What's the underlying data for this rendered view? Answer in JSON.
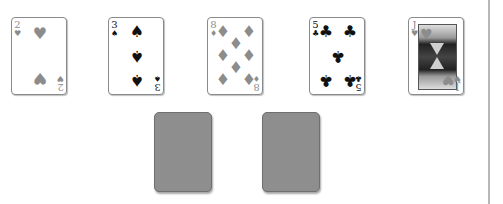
{
  "colors": {
    "red_suit": "#8c8c8c",
    "black_suit": "#111111",
    "card_back": "#8e8e8e",
    "divider": "#b8b8b8"
  },
  "hand": [
    {
      "rank": "2",
      "suit": "♥",
      "suit_name": "hearts",
      "color": "red"
    },
    {
      "rank": "3",
      "suit": "♠",
      "suit_name": "spades",
      "color": "black"
    },
    {
      "rank": "8",
      "suit": "♦",
      "suit_name": "diamonds",
      "color": "red"
    },
    {
      "rank": "5",
      "suit": "♣",
      "suit_name": "clubs",
      "color": "black"
    },
    {
      "rank": "J",
      "suit": "♥",
      "suit_name": "hearts",
      "color": "red"
    }
  ],
  "face_down": [
    {
      "state": "face-down"
    },
    {
      "state": "face-down"
    }
  ]
}
